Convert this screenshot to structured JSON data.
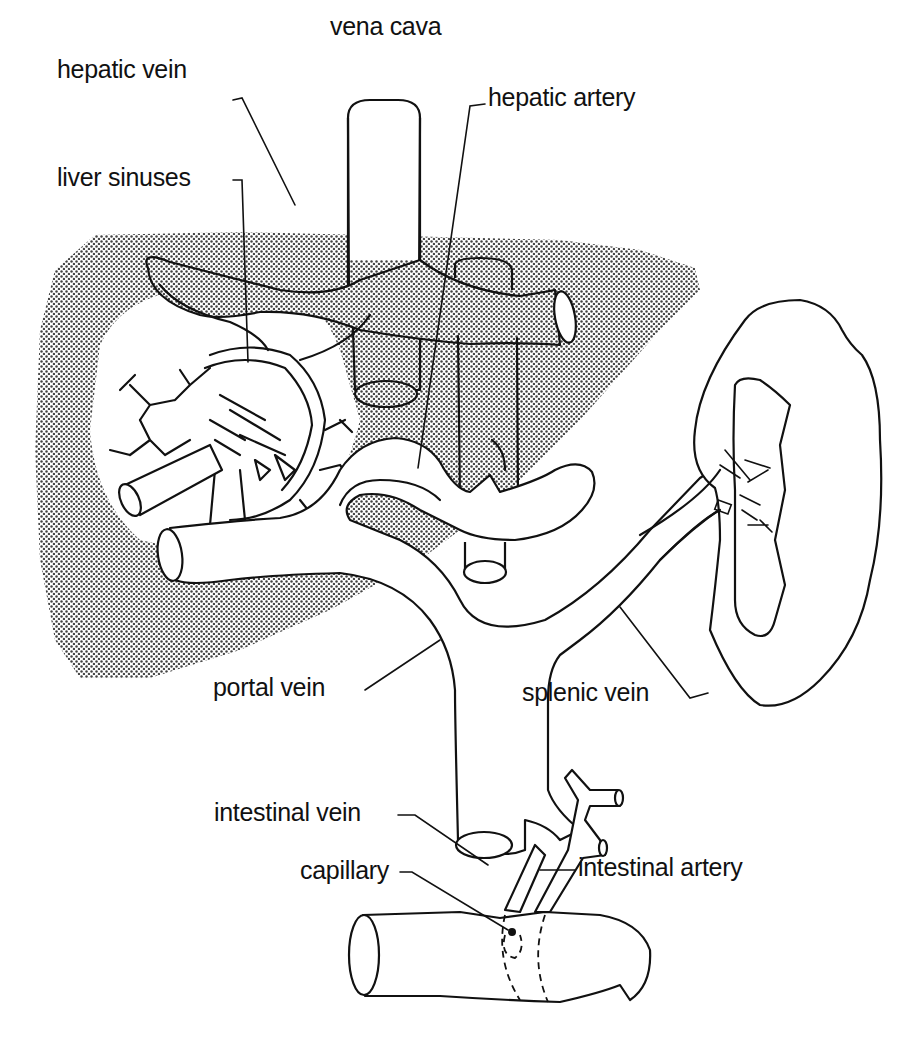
{
  "diagram": {
    "colors": {
      "ink": "#111111",
      "background": "#ffffff",
      "liver_stipple": "#555555"
    },
    "labels": {
      "vena_cava": "vena cava",
      "hepatic_vein": "hepatic vein",
      "hepatic_artery": "hepatic artery",
      "liver_sinuses": "liver sinuses",
      "portal_vein": "portal vein",
      "splenic_vein": "splenic vein",
      "intestinal_vein": "intestinal vein",
      "capillary": "capillary",
      "intestinal_artery": "intestinal artery"
    },
    "structures": [
      {
        "id": "liver",
        "fill": "stippled"
      },
      {
        "id": "vena-cava"
      },
      {
        "id": "hepatic-vein"
      },
      {
        "id": "hepatic-artery"
      },
      {
        "id": "liver-sinuses"
      },
      {
        "id": "portal-vein"
      },
      {
        "id": "spleen"
      },
      {
        "id": "splenic-vein"
      },
      {
        "id": "intestinal-vein"
      },
      {
        "id": "intestinal-artery"
      },
      {
        "id": "capillary"
      },
      {
        "id": "intestine"
      }
    ]
  }
}
